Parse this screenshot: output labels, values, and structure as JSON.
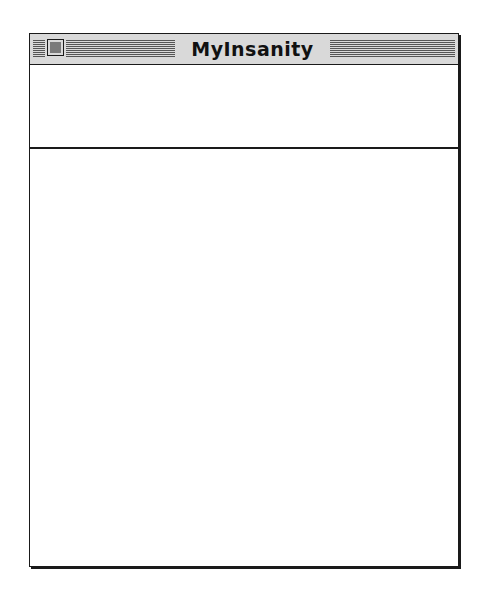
{
  "window": {
    "title": "MyInsanity",
    "close_box_icon": "close-box-icon",
    "header_pane_text": "",
    "content_pane_text": ""
  },
  "colors": {
    "titlebar_bg": "#d9d9d9",
    "stripe": "#555555",
    "border": "#1a1a1a",
    "close_box_fill": "#7a7a7a",
    "window_bg": "#ffffff"
  }
}
